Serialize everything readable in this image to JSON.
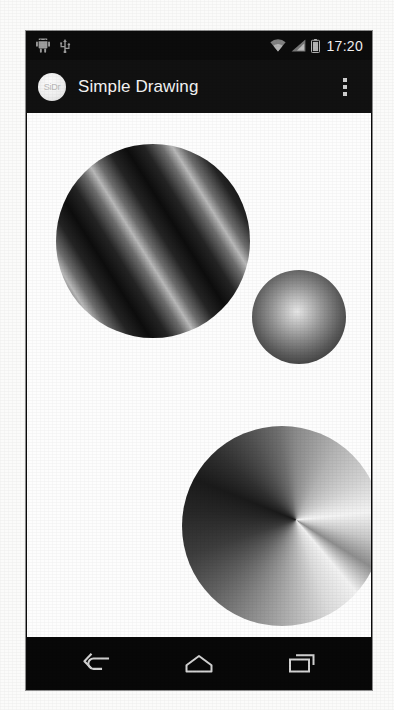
{
  "platform": "android",
  "status_bar": {
    "left_icons": [
      {
        "name": "android-robot-icon",
        "label": "Android"
      },
      {
        "name": "usb-icon",
        "label": "USB"
      }
    ],
    "right_icons": [
      {
        "name": "wifi-icon",
        "label": "Wi-Fi"
      },
      {
        "name": "signal-icon",
        "label": "Cellular signal"
      },
      {
        "name": "battery-icon",
        "label": "Battery"
      }
    ],
    "time": "17:20"
  },
  "action_bar": {
    "app_icon_text": "SiDr",
    "title": "Simple Drawing",
    "overflow_label": "More options"
  },
  "canvas": {
    "background_color": "#fdfdfd",
    "shapes": [
      {
        "name": "circle-linear-gradient",
        "gradient_type": "linear-sweep-repeating",
        "cx": 126,
        "cy": 212,
        "radius": 97,
        "colors": [
          "#0d0d0d",
          "#b9b9b9"
        ]
      },
      {
        "name": "circle-radial-gradient",
        "gradient_type": "radial",
        "cx": 272,
        "cy": 286,
        "radius": 47,
        "colors": [
          "#e6e6e6",
          "#202020"
        ]
      },
      {
        "name": "circle-sweep-gradient",
        "gradient_type": "sweep",
        "cx": 255,
        "cy": 495,
        "radius": 100,
        "colors": [
          "#f4f4f4",
          "#1a1a1a"
        ]
      }
    ]
  },
  "navigation_bar": {
    "buttons": [
      {
        "name": "back-button",
        "label": "Back"
      },
      {
        "name": "home-button",
        "label": "Home"
      },
      {
        "name": "recents-button",
        "label": "Recent apps"
      }
    ]
  }
}
